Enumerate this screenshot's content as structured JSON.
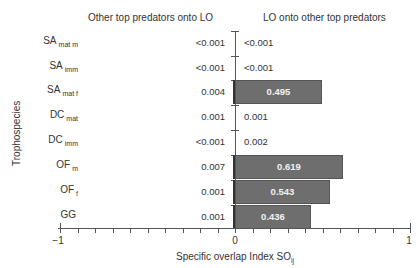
{
  "chart_data": {
    "type": "bar",
    "orientation": "horizontal",
    "title": "",
    "left_panel_title": "Other top predators onto LO",
    "right_panel_title": "LO onto other top predators",
    "xlabel": "Specific overlap Index SO",
    "xlabel_subscript": "ij",
    "ylabel": "Trophospecies",
    "xlim": [
      -1,
      1
    ],
    "xticks": [
      -1,
      0,
      1
    ],
    "minor_tick_step": 0.1,
    "categories": [
      {
        "base": "SA",
        "sub": "mat m"
      },
      {
        "base": "SA",
        "sub": "imm"
      },
      {
        "base": "SA",
        "sub": "mat f"
      },
      {
        "base": "DC",
        "sub": "mat"
      },
      {
        "base": "DC",
        "sub": "imm"
      },
      {
        "base": "OF",
        "sub": "m"
      },
      {
        "base": "OF",
        "sub": "f"
      },
      {
        "base": "GG",
        "sub": ""
      }
    ],
    "series": [
      {
        "name": "Other top predators onto LO",
        "labels": [
          "<0.001",
          "<0.001",
          "0.004",
          "0.001",
          "<0.001",
          "0.007",
          "0.001",
          "0.001"
        ],
        "values": [
          0.0005,
          0.0005,
          0.004,
          0.001,
          0.0005,
          0.007,
          0.001,
          0.001
        ]
      },
      {
        "name": "LO onto other top predators",
        "labels": [
          "<0.001",
          "<0.001",
          "0.495",
          "0.001",
          "0.002",
          "0.619",
          "0.543",
          "0.436"
        ],
        "values": [
          0.0005,
          0.0005,
          0.495,
          0.001,
          0.002,
          0.619,
          0.543,
          0.436
        ]
      }
    ],
    "bar_color": "#6e6e6e",
    "grid": false
  },
  "labels": {
    "left_title": "Other top predators onto LO",
    "right_title": "LO onto other top predators",
    "ytitle": "Trophospecies",
    "xtitle": "Specific overlap Index SO",
    "xtitle_sub": "ij",
    "tick_neg1": "−1",
    "tick_0": "0",
    "tick_1": "1",
    "rows": [
      {
        "base": "SA",
        "sub": "mat m",
        "left": "<0.001",
        "right": "<0.001"
      },
      {
        "base": "SA",
        "sub": "imm",
        "left": "<0.001",
        "right": "<0.001"
      },
      {
        "base": "SA",
        "sub": "mat f",
        "left": "0.004",
        "right": "0.495"
      },
      {
        "base": "DC",
        "sub": "mat",
        "left": "0.001",
        "right": "0.001"
      },
      {
        "base": "DC",
        "sub": "imm",
        "left": "<0.001",
        "right": "0.002"
      },
      {
        "base": "OF",
        "sub": "m",
        "left": "0.007",
        "right": "0.619"
      },
      {
        "base": "OF",
        "sub": "f",
        "left": "0.001",
        "right": "0.543"
      },
      {
        "base": "GG",
        "sub": "",
        "left": "0.001",
        "right": "0.436"
      }
    ]
  }
}
